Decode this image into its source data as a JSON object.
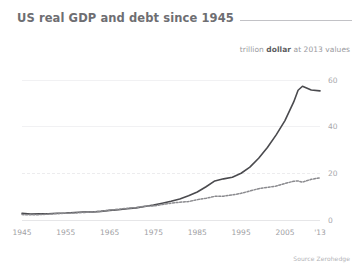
{
  "header": {
    "title": "US real GDP and debt since 1945",
    "rule": "horizontal-rule"
  },
  "subtitle": {
    "prefix": "trillion ",
    "emphasis": "dollar",
    "suffix": " at 2013 values"
  },
  "footer": {
    "source": "Source Zerohedge"
  },
  "colors": {
    "title": "#6e6e72",
    "debt_line": "#4a4a4e",
    "gdp_line": "#8a8a8e",
    "grid": "#f1f1f3",
    "axis_text": "#a8a8ac",
    "background": "#ffffff"
  },
  "chart_data": {
    "type": "line",
    "title": "US real GDP and debt since 1945",
    "subtitle": "trillion dollar at 2013 values",
    "source": "Source Zerohedge",
    "xlabel": "",
    "ylabel": "trillion dollar at 2013 values",
    "xlim": [
      1945,
      2013
    ],
    "ylim": [
      0,
      65
    ],
    "yticks": [
      0,
      20,
      40,
      60
    ],
    "ytick_labels": [
      "0",
      "20",
      "40",
      "60"
    ],
    "xticks": [
      1945,
      1955,
      1965,
      1975,
      1985,
      1995,
      2005,
      2013
    ],
    "xtick_labels": [
      "1945",
      "1955",
      "1965",
      "1975",
      "1985",
      "1995",
      "2005",
      "'13"
    ],
    "grid": "horizontal",
    "legend": "none",
    "x": [
      1945,
      1947,
      1949,
      1951,
      1953,
      1955,
      1957,
      1959,
      1961,
      1963,
      1965,
      1967,
      1969,
      1971,
      1973,
      1975,
      1977,
      1979,
      1981,
      1983,
      1985,
      1987,
      1989,
      1991,
      1993,
      1995,
      1997,
      1999,
      2001,
      2003,
      2005,
      2007,
      2008,
      2009,
      2011,
      2013
    ],
    "series": [
      {
        "name": "debt",
        "style": "solid",
        "color": "#4a4a4e",
        "values": [
          2.9,
          2.5,
          2.6,
          2.7,
          2.9,
          3.0,
          3.2,
          3.4,
          3.4,
          3.7,
          4.1,
          4.4,
          4.8,
          5.2,
          5.8,
          6.4,
          7.2,
          8.0,
          9.0,
          10.4,
          12.0,
          14.2,
          16.7,
          17.6,
          18.3,
          20.0,
          22.6,
          26.4,
          31.0,
          36.4,
          42.5,
          50.5,
          55.5,
          57.2,
          55.6,
          55.2
        ]
      },
      {
        "name": "gdp",
        "style": "dotted",
        "color": "#8a8a8e",
        "values": [
          2.3,
          2.2,
          2.3,
          2.5,
          2.7,
          2.9,
          3.0,
          3.2,
          3.4,
          3.7,
          4.2,
          4.6,
          5.0,
          5.3,
          5.9,
          6.0,
          6.6,
          7.2,
          7.6,
          7.9,
          8.7,
          9.3,
          10.1,
          10.2,
          10.7,
          11.4,
          12.4,
          13.4,
          14.0,
          14.5,
          15.6,
          16.6,
          16.7,
          16.2,
          17.4,
          18.0
        ]
      }
    ]
  }
}
